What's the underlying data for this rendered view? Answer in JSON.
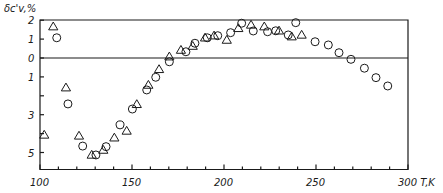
{
  "chart_data": {
    "type": "scatter",
    "title": "",
    "xlabel": "T,K",
    "ylabel": "δc'v,%",
    "xlim": [
      100,
      300
    ],
    "ylim": [
      -5.9,
      2
    ],
    "grid": false,
    "legend": null,
    "x_tick_labels": [
      "100",
      "150",
      "200",
      "250",
      "300 T,K"
    ],
    "x_ticks_major": [
      100,
      150,
      200,
      250,
      300
    ],
    "x_ticks_minor": [
      110,
      120,
      130,
      140,
      160,
      170,
      180,
      190,
      210,
      220,
      230,
      240,
      260,
      270,
      280,
      290
    ],
    "y_ticks": [
      2,
      1,
      0,
      -1,
      -2,
      -3,
      -4,
      -5
    ],
    "y_tick_labels": [
      {
        "value": 2,
        "text": "2"
      },
      {
        "value": 1,
        "text": "1"
      },
      {
        "value": 0,
        "text": "0"
      },
      {
        "value": -1,
        "text": "1"
      },
      {
        "value": -3,
        "text": "3"
      },
      {
        "value": -5,
        "text": "5"
      }
    ],
    "reference_line": 0,
    "series": [
      {
        "name": "triangles",
        "marker": "triangle",
        "points": [
          [
            102.3,
            -4.07
          ],
          [
            107.2,
            1.66
          ],
          [
            114.1,
            -1.57
          ],
          [
            121.2,
            -4.12
          ],
          [
            128.1,
            -5.13
          ],
          [
            134.4,
            -4.87
          ],
          [
            140.4,
            -4.22
          ],
          [
            147.1,
            -3.86
          ],
          [
            152.6,
            -2.45
          ],
          [
            158.9,
            -1.43
          ],
          [
            164.7,
            -0.6
          ],
          [
            170.3,
            0.07
          ],
          [
            176.6,
            0.42
          ],
          [
            183.0,
            0.63
          ],
          [
            189.7,
            1.07
          ],
          [
            194.6,
            1.18
          ],
          [
            201.5,
            0.95
          ],
          [
            207.8,
            1.57
          ],
          [
            214.7,
            1.75
          ],
          [
            221.9,
            1.66
          ],
          [
            229.9,
            1.44
          ],
          [
            236.8,
            1.13
          ],
          [
            242.2,
            1.22
          ]
        ]
      },
      {
        "name": "circles",
        "marker": "circle",
        "points": [
          [
            109.1,
            1.07
          ],
          [
            115.2,
            -2.43
          ],
          [
            123.2,
            -4.66
          ],
          [
            130.4,
            -5.13
          ],
          [
            135.9,
            -4.69
          ],
          [
            143.5,
            -3.54
          ],
          [
            150.2,
            -2.7
          ],
          [
            158.0,
            -1.69
          ],
          [
            162.9,
            -1.02
          ],
          [
            170.3,
            -0.2
          ],
          [
            179.3,
            0.33
          ],
          [
            184.2,
            0.78
          ],
          [
            190.9,
            1.07
          ],
          [
            196.6,
            1.18
          ],
          [
            203.6,
            1.34
          ],
          [
            209.6,
            1.84
          ],
          [
            215.9,
            1.43
          ],
          [
            223.7,
            1.39
          ],
          [
            228.1,
            1.44
          ],
          [
            234.9,
            1.22
          ],
          [
            239.0,
            1.87
          ],
          [
            249.5,
            0.86
          ],
          [
            256.7,
            0.69
          ],
          [
            262.5,
            0.28
          ],
          [
            269.0,
            -0.07
          ],
          [
            276.3,
            -0.54
          ],
          [
            282.6,
            -1.04
          ],
          [
            289.0,
            -1.48
          ]
        ]
      }
    ]
  },
  "labels": {
    "y_axis_title": "δc'v,%",
    "x_axis_unit": "T,K"
  }
}
